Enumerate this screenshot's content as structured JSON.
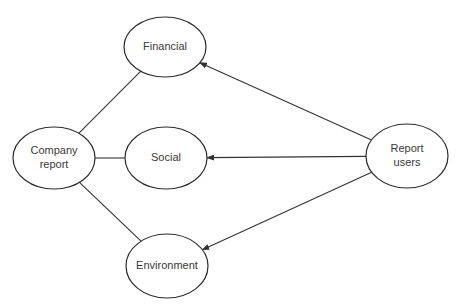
{
  "diagram": {
    "type": "concept-map",
    "colors": {
      "background": "#ffffff",
      "stroke": "#2b2b2b",
      "text": "#3a3a3a"
    },
    "nodes": [
      {
        "id": "company",
        "lines": [
          "Company",
          "report"
        ],
        "cx": 54,
        "cy": 158,
        "rx": 41,
        "ry": 31
      },
      {
        "id": "financial",
        "lines": [
          "Financial"
        ],
        "cx": 165,
        "cy": 47,
        "rx": 41,
        "ry": 30
      },
      {
        "id": "social",
        "lines": [
          "Social"
        ],
        "cx": 166,
        "cy": 158,
        "rx": 41,
        "ry": 31
      },
      {
        "id": "environment",
        "lines": [
          "Environment"
        ],
        "cx": 167,
        "cy": 266,
        "rx": 41,
        "ry": 32
      },
      {
        "id": "users",
        "lines": [
          "Report",
          "users"
        ],
        "cx": 407,
        "cy": 156,
        "rx": 41,
        "ry": 32
      }
    ],
    "edges": [
      {
        "from": "company",
        "to": "financial",
        "arrow": false
      },
      {
        "from": "company",
        "to": "social",
        "arrow": false
      },
      {
        "from": "company",
        "to": "environment",
        "arrow": false
      },
      {
        "from": "users",
        "to": "financial",
        "arrow": true
      },
      {
        "from": "users",
        "to": "social",
        "arrow": true
      },
      {
        "from": "users",
        "to": "environment",
        "arrow": true
      }
    ]
  }
}
